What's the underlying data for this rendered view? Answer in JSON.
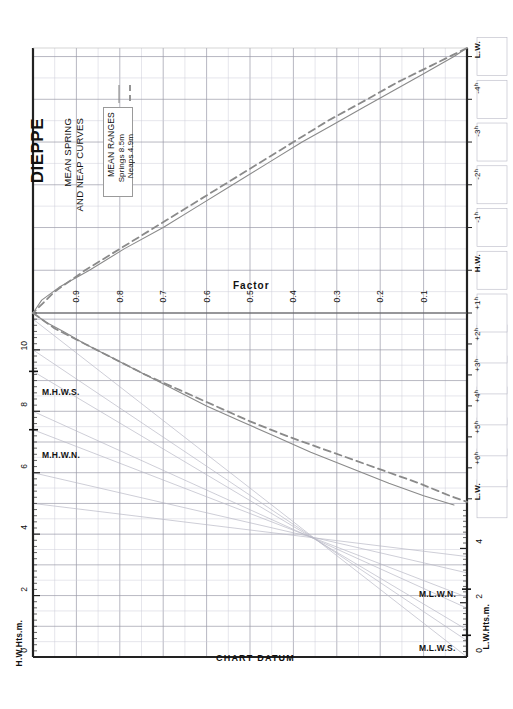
{
  "header": {
    "port": "DIEPPE",
    "subtitle_line1": "MEAN SPRING",
    "subtitle_line2": "AND NEAP CURVES"
  },
  "legend": {
    "title": "MEAN RANGES",
    "items": [
      {
        "label": "Springs 8.5m",
        "style": "solid",
        "color": "#8a8a8a"
      },
      {
        "label": "Neaps  4.9m",
        "style": "dashed",
        "color": "#8a8a8a"
      }
    ]
  },
  "axes": {
    "left_title": "H.W.Hts.m.",
    "right_title": "L.W.Hts.m.",
    "datum_label": "CHART DATUM",
    "factor_label": "Factor",
    "left_ticks": [
      "0",
      "2",
      "4",
      "6",
      "8",
      "10"
    ],
    "right_ticks": [
      "0",
      "2",
      "4"
    ],
    "factor_values": [
      "0.9",
      "0.8",
      "0.7",
      "0.6",
      "0.5",
      "0.4",
      "0.3",
      "0.2",
      "0.1"
    ],
    "hour_labels": [
      "L.W.",
      "+6ʰ",
      "+5ʰ",
      "+4ʰ",
      "+3ʰ",
      "+2ʰ",
      "+1ʰ",
      "H.W.",
      "-1ʰ",
      "-2ʰ",
      "-3ʰ",
      "-4ʰ",
      "L.W."
    ]
  },
  "markers": {
    "mhws": "M.H.W.S.",
    "mhwn": "M.H.W.N.",
    "mlwn": "M.L.W.N.",
    "mlws": "M.L.W.S."
  },
  "chart_data": {
    "type": "line",
    "title": "DIEPPE MEAN SPRING AND NEAP CURVES",
    "xlabel": "Factor",
    "ylabel": "Height (m)",
    "grid": true,
    "legend_position": "upper-left",
    "mean_ranges": {
      "springs_m": 8.5,
      "neaps_m": 4.9
    },
    "tidal_levels": {
      "mhws_m": 9.3,
      "mhwn_m": 7.4,
      "mlwn_m": 2.5,
      "mlws_m": 0.8
    },
    "hw_height_axis": {
      "min": 0,
      "max": 11.2,
      "major_step": 2,
      "minor_step": 0.2
    },
    "lw_height_axis": {
      "min": 0,
      "max": 5.6,
      "major_step": 2,
      "minor_step": 0.2
    },
    "time_axis": {
      "hours": [
        -6,
        -5,
        -4,
        -3,
        -2,
        -1,
        0,
        1,
        2,
        3,
        4,
        5,
        6
      ],
      "hw_at": 0
    },
    "series": [
      {
        "name": "Springs 8.5m",
        "style": "solid",
        "comment": "Factor vs time, upper branch = rising to HW, lower branch = falling from HW",
        "rising_factor_by_hour": [
          {
            "h": -6.2,
            "f": 0.0
          },
          {
            "h": -6.0,
            "f": 0.03
          },
          {
            "h": -5.6,
            "f": 0.1
          },
          {
            "h": -5.2,
            "f": 0.17
          },
          {
            "h": -4.8,
            "f": 0.24
          },
          {
            "h": -4.4,
            "f": 0.31
          },
          {
            "h": -4.0,
            "f": 0.38
          },
          {
            "h": -3.5,
            "f": 0.46
          },
          {
            "h": -3.0,
            "f": 0.54
          },
          {
            "h": -2.5,
            "f": 0.62
          },
          {
            "h": -2.0,
            "f": 0.7
          },
          {
            "h": -1.5,
            "f": 0.79
          },
          {
            "h": -1.0,
            "f": 0.87
          },
          {
            "h": -0.6,
            "f": 0.94
          },
          {
            "h": -0.3,
            "f": 0.98
          },
          {
            "h": 0.0,
            "f": 1.0
          }
        ],
        "falling_factor_by_hour": [
          {
            "h": 0.0,
            "f": 1.0
          },
          {
            "h": 0.3,
            "f": 0.97
          },
          {
            "h": 0.6,
            "f": 0.93
          },
          {
            "h": 1.0,
            "f": 0.88
          },
          {
            "h": 1.5,
            "f": 0.81
          },
          {
            "h": 2.0,
            "f": 0.74
          },
          {
            "h": 2.5,
            "f": 0.67
          },
          {
            "h": 3.0,
            "f": 0.6
          },
          {
            "h": 3.5,
            "f": 0.52
          },
          {
            "h": 4.0,
            "f": 0.44
          },
          {
            "h": 4.5,
            "f": 0.36
          },
          {
            "h": 5.0,
            "f": 0.27
          },
          {
            "h": 5.5,
            "f": 0.18
          },
          {
            "h": 5.9,
            "f": 0.1
          },
          {
            "h": 6.2,
            "f": 0.03
          }
        ]
      },
      {
        "name": "Neaps 4.9m",
        "style": "dashed",
        "rising_factor_by_hour": [
          {
            "h": -6.2,
            "f": 0.0
          },
          {
            "h": -5.8,
            "f": 0.08
          },
          {
            "h": -5.4,
            "f": 0.16
          },
          {
            "h": -5.0,
            "f": 0.23
          },
          {
            "h": -4.5,
            "f": 0.32
          },
          {
            "h": -4.0,
            "f": 0.4
          },
          {
            "h": -3.5,
            "f": 0.48
          },
          {
            "h": -3.0,
            "f": 0.56
          },
          {
            "h": -2.5,
            "f": 0.64
          },
          {
            "h": -2.0,
            "f": 0.72
          },
          {
            "h": -1.5,
            "f": 0.8
          },
          {
            "h": -1.0,
            "f": 0.88
          },
          {
            "h": -0.5,
            "f": 0.95
          },
          {
            "h": 0.0,
            "f": 1.0
          }
        ],
        "falling_factor_by_hour": [
          {
            "h": 0.0,
            "f": 1.0
          },
          {
            "h": 0.5,
            "f": 0.95
          },
          {
            "h": 1.0,
            "f": 0.88
          },
          {
            "h": 1.5,
            "f": 0.81
          },
          {
            "h": 2.0,
            "f": 0.74
          },
          {
            "h": 2.5,
            "f": 0.66
          },
          {
            "h": 3.0,
            "f": 0.58
          },
          {
            "h": 3.5,
            "f": 0.5
          },
          {
            "h": 4.0,
            "f": 0.41
          },
          {
            "h": 4.5,
            "f": 0.31
          },
          {
            "h": 5.0,
            "f": 0.21
          },
          {
            "h": 5.5,
            "f": 0.11
          },
          {
            "h": 5.9,
            "f": 0.04
          },
          {
            "h": 6.1,
            "f": 0.0
          }
        ]
      }
    ],
    "range_lines": [
      {
        "hw": 11.0,
        "lw": 0.0
      },
      {
        "hw": 10.0,
        "lw": 0.6
      },
      {
        "hw": 9.3,
        "lw": 1.0
      },
      {
        "hw": 8.0,
        "lw": 1.8
      },
      {
        "hw": 7.4,
        "lw": 2.2
      },
      {
        "hw": 6.0,
        "lw": 3.1
      },
      {
        "hw": 5.0,
        "lw": 3.7
      }
    ]
  }
}
